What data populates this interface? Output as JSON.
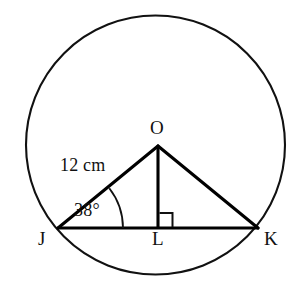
{
  "diagram": {
    "type": "geometry-figure",
    "colors": {
      "stroke": "#111111",
      "triangle_stroke": "#000000",
      "background": "#ffffff"
    },
    "circle": {
      "name": "circle-O",
      "center_label": "O",
      "center_x": 155,
      "center_y": 145,
      "radius": 130
    },
    "points": [
      {
        "label": "O",
        "role": "center-apex",
        "x": 158,
        "y": 146
      },
      {
        "label": "J",
        "role": "chord-endpoint-left",
        "x": 58,
        "y": 228
      },
      {
        "label": "L",
        "role": "foot-of-perpendicular",
        "x": 158,
        "y": 228
      },
      {
        "label": "K",
        "role": "chord-endpoint-right",
        "x": 258,
        "y": 228
      }
    ],
    "labels": {
      "center": "O",
      "left_vertex": "J",
      "foot": "L",
      "right_vertex": "K",
      "radius_measure": "12 cm",
      "angle_measure": "38°"
    },
    "segments": [
      {
        "name": "radius-JO",
        "from": "J",
        "to": "O",
        "measure": "12 cm"
      },
      {
        "name": "radius-OK",
        "from": "O",
        "to": "K",
        "measure": ""
      },
      {
        "name": "chord-JK",
        "from": "J",
        "to": "K",
        "measure": ""
      },
      {
        "name": "altitude-OL",
        "from": "O",
        "to": "L",
        "measure": ""
      }
    ],
    "angles": [
      {
        "name": "angle-OJL",
        "vertex": "J",
        "value": "38°",
        "marker": "arc"
      },
      {
        "name": "angle-OLK",
        "vertex": "L",
        "value": "90°",
        "marker": "right-angle-square"
      }
    ]
  }
}
